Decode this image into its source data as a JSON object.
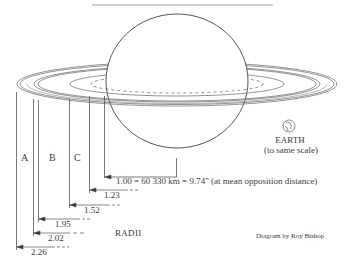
{
  "figure": {
    "ring_labels": [
      "A",
      "B",
      "C"
    ],
    "radii_title": "RADII",
    "radii": [
      {
        "value": "1.00",
        "meaning": "planet equatorial radius"
      },
      {
        "value": "1.23",
        "meaning": "inner edge of C ring"
      },
      {
        "value": "1.52",
        "meaning": "outer edge of C ring / inner edge of B ring"
      },
      {
        "value": "1.95",
        "meaning": "outer edge of B ring"
      },
      {
        "value": "2.02",
        "meaning": "inner edge of A ring"
      },
      {
        "value": "2.26",
        "meaning": "outer edge of A ring"
      }
    ],
    "scale_caption": "1.00 = 60 330 km = 9.74\" (at mean opposition distance)",
    "earth": {
      "title": "EARTH",
      "subtitle": "(to same scale)",
      "icon": "earth-globe-icon"
    },
    "credit": "Diagram by Roy Bishop",
    "colors": {
      "line": "#555555",
      "text": "#3a3a3a",
      "background": "#ffffff"
    }
  }
}
